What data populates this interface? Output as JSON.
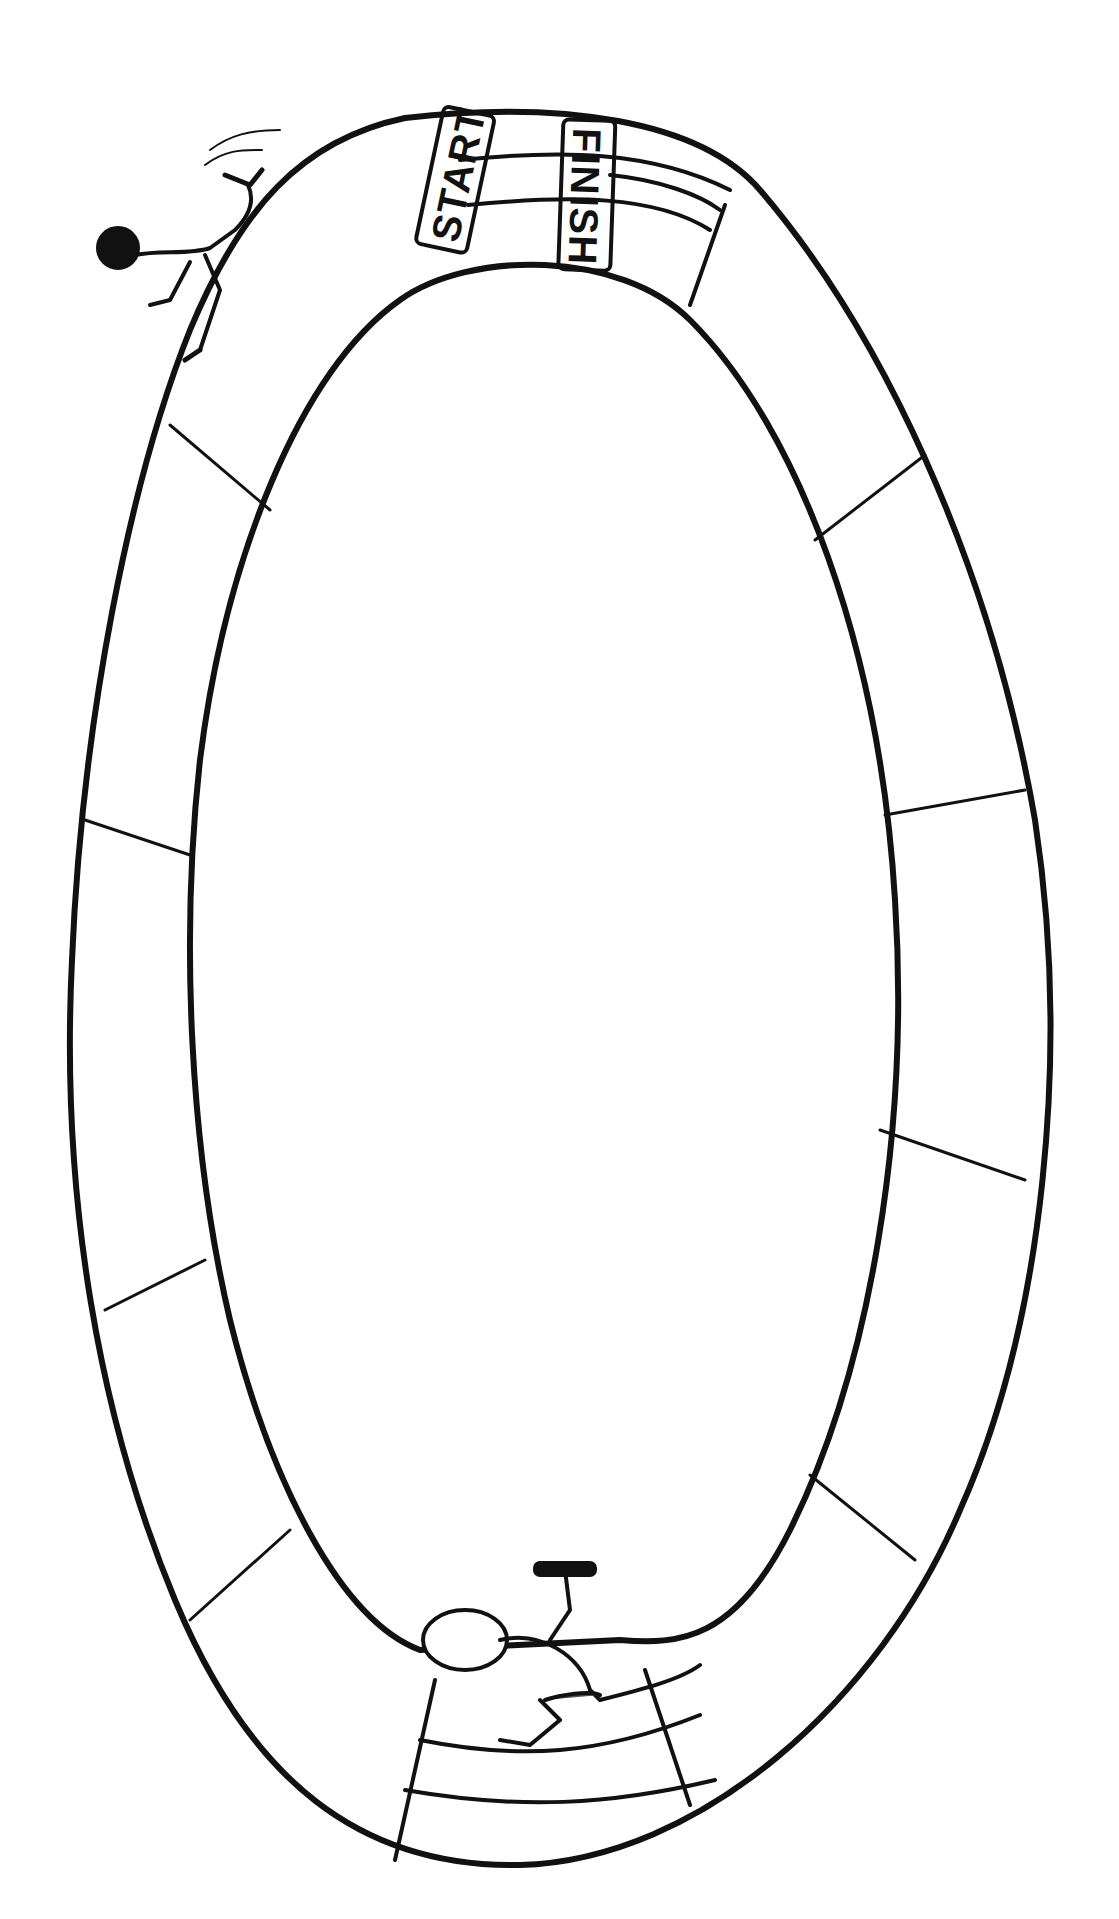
{
  "illustration": {
    "subject": "Oval running track board game",
    "start_label": "START",
    "finish_label": "FINISH",
    "colors": {
      "ink": "#111111",
      "background": "#ffffff"
    },
    "figures": [
      {
        "name": "runner-top-left",
        "description": "runner leaping at top-left of track"
      },
      {
        "name": "runner-bottom-relay",
        "description": "relay runner holding baton at bottom of track"
      }
    ],
    "track": {
      "lanes_at_start": 3,
      "segments": 18
    }
  }
}
